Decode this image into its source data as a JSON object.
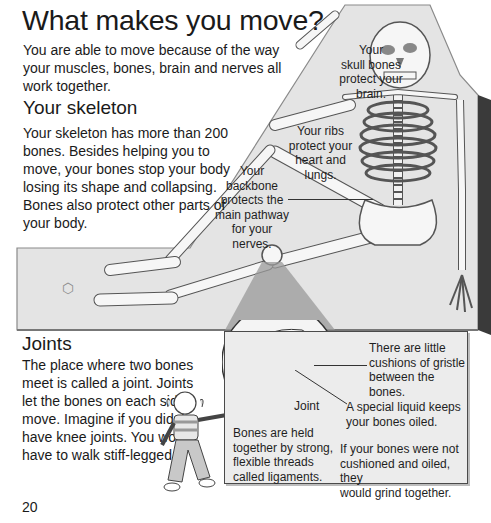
{
  "page": {
    "title": "What makes you move?",
    "intro": "You are able to move because of the way your muscles, bones, brain and nerves all work together.",
    "page_number": "20"
  },
  "skeleton_section": {
    "heading": "Your skeleton",
    "paragraph": "Your skeleton has more than 200 bones. Besides helping you to move, your bones stop your body losing its shape and collapsing. Bones also protect other parts of your body."
  },
  "joints_section": {
    "heading": "Joints",
    "paragraph": "The place where two bones meet is called a joint. Joints let the bones on each side move. Imagine if you didn't have knee joints. You would have to walk stiff-legged."
  },
  "skeleton_labels": {
    "skull": [
      "Your",
      "skull bones",
      "protect your",
      "brain."
    ],
    "ribs": [
      "Your ribs",
      "protect your",
      "heart and",
      "lungs."
    ],
    "backbone": [
      "Your",
      "backbone",
      "protects the",
      "main pathway",
      "for your nerves."
    ]
  },
  "joint_box": {
    "cushions": [
      "There are little",
      "cushions of gristle",
      "between the bones."
    ],
    "joint_label": "Joint",
    "liquid": [
      "A special liquid keeps",
      "your bones oiled."
    ],
    "ligaments": [
      "Bones are held",
      "together by strong,",
      "flexible threads",
      "called ligaments."
    ],
    "grind": [
      "If your bones were not",
      "cushioned and oiled, they",
      "would grind together."
    ]
  },
  "colors": {
    "panel_gray": "#e4e4e4",
    "panel_edge": "#8a8a8a",
    "bone": "#f6f6f6",
    "bone_outline": "#555555",
    "box_bg": "#ececec",
    "box_border": "#4a4a4a",
    "text": "#1a1a1a"
  }
}
